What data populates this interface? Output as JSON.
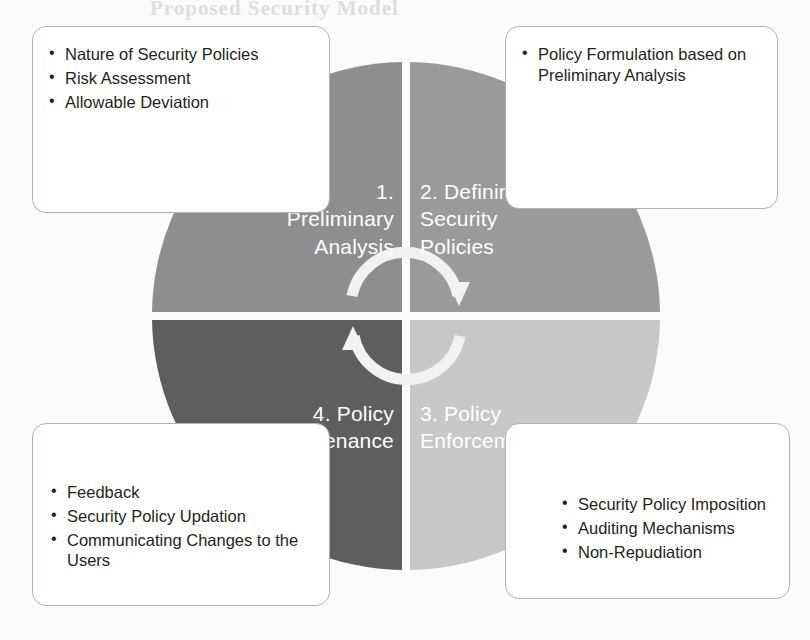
{
  "diagram": {
    "type": "four-quadrant-cycle",
    "center_icon": "circular-arrows-icon",
    "quadrants": [
      {
        "number": "1.",
        "name": "Preliminary Analysis",
        "label": "1.\nPreliminary\nAnalysis",
        "position": "top-left",
        "color": "#8e8e8e",
        "callout": {
          "position": "top-left",
          "items": [
            "Nature of Security Policies",
            "Risk Assessment",
            "Allowable Deviation"
          ]
        }
      },
      {
        "number": "2.",
        "name": "Defining Security Policies",
        "label": "2. Defining\nSecurity\nPolicies",
        "position": "top-right",
        "color": "#9a9a9a",
        "callout": {
          "position": "top-right",
          "items": [
            "Policy Formulation based on Preliminary Analysis"
          ]
        }
      },
      {
        "number": "3.",
        "name": "Policy Enforcement",
        "label": "3. Policy\nEnforcement",
        "position": "bottom-right",
        "color": "#c8c8c8",
        "callout": {
          "position": "bottom-right",
          "items": [
            "Security Policy Imposition",
            "Auditing Mechanisms",
            "Non-Repudiation"
          ]
        }
      },
      {
        "number": "4.",
        "name": "Policy Maintenance",
        "label": "4. Policy\nMaintenance",
        "position": "bottom-left",
        "color": "#5e5e5e",
        "callout": {
          "position": "bottom-left",
          "items": [
            "Feedback",
            "Security Policy Updation",
            "Communicating Changes to the Users"
          ]
        }
      }
    ]
  },
  "labels": {
    "q1": "1.\nPreliminary\nAnalysis",
    "q2": "2. Defining\nSecurity\nPolicies",
    "q3": "3. Policy\nEnforcement",
    "q4": "4. Policy\nMaintenance"
  },
  "callouts": {
    "preliminary": [
      "Nature of Security Policies",
      "Risk Assessment",
      "Allowable Deviation"
    ],
    "defining": [
      "Policy Formulation based on Preliminary Analysis"
    ],
    "enforcement": [
      "Security Policy Imposition",
      "Auditing Mechanisms",
      "Non-Repudiation"
    ],
    "maintenance": [
      "Feedback",
      "Security Policy Updation",
      "Communicating Changes to the Users"
    ]
  },
  "background_bleed": {
    "line_top": "Proposed Security Model",
    "line_title": "roposed Security",
    "line_a": "tion, we discuss the",
    "line_b": "g",
    "line_c": "at Conf",
    "line_d": "Definition",
    "line_e": "Feedback of",
    "line_f": "the prot",
    "line_g": "wirh intro"
  },
  "colors": {
    "quadrant_1": "#8e8e8e",
    "quadrant_2": "#9a9a9a",
    "quadrant_3": "#c8c8c8",
    "quadrant_4": "#5e5e5e",
    "callout_border": "#a9b4ba",
    "callout_fill": "#ffffff",
    "label_text": "#ffffff",
    "body_text": "#231f20",
    "page_background": "#fbfbfa"
  }
}
